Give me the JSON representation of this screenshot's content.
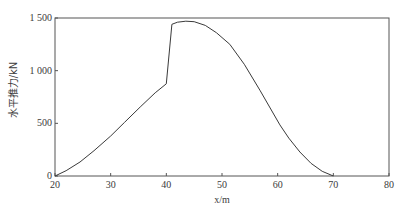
{
  "chart_data": {
    "type": "line",
    "title": "",
    "xlabel": "x/m",
    "ylabel": "水平推力/kN",
    "xlim": [
      20,
      80
    ],
    "ylim": [
      0,
      1500
    ],
    "xticks": [
      20,
      30,
      40,
      50,
      60,
      70,
      80
    ],
    "yticks": [
      0,
      500,
      1000,
      1500
    ],
    "xtick_labels": [
      "20",
      "30",
      "40",
      "50",
      "60",
      "70",
      "80"
    ],
    "ytick_labels": [
      "0",
      "500",
      "1 000",
      "1 500"
    ],
    "grid": false,
    "legend": null,
    "series": [
      {
        "name": "水平推力",
        "color": "#3a3a3a",
        "x": [
          20,
          22,
          24.5,
          27,
          30,
          32.5,
          35.3,
          38,
          40,
          41,
          42,
          43.5,
          45,
          47,
          49,
          51.4,
          54,
          56.8,
          60.4,
          62,
          64,
          66,
          68,
          70
        ],
        "y": [
          0,
          50,
          133,
          240,
          380,
          510,
          655,
          790,
          875,
          1440,
          1460,
          1470,
          1465,
          1430,
          1360,
          1250,
          1060,
          815,
          485,
          360,
          228,
          120,
          45,
          0
        ]
      }
    ]
  }
}
